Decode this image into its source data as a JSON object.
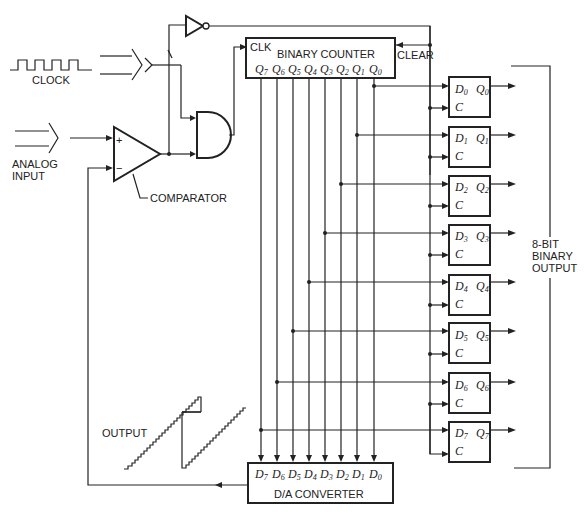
{
  "diagram": {
    "type": "ramp-type analog-to-digital converter block diagram",
    "labels": {
      "clock": "CLOCK",
      "analog_input_line1": "ANALOG",
      "analog_input_line2": "INPUT",
      "comparator": "COMPARATOR",
      "comparator_plus": "+",
      "comparator_minus": "−",
      "output_waveform": "OUTPUT",
      "binary_output_line1": "8-BIT",
      "binary_output_line2": "BINARY",
      "binary_output_line3": "OUTPUT",
      "clear": "CLEAR"
    },
    "binary_counter": {
      "title": "BINARY COUNTER",
      "clk_label": "CLK",
      "outputs": [
        {
          "letter": "Q",
          "sub": "7"
        },
        {
          "letter": "Q",
          "sub": "6"
        },
        {
          "letter": "Q",
          "sub": "5"
        },
        {
          "letter": "Q",
          "sub": "4"
        },
        {
          "letter": "Q",
          "sub": "3"
        },
        {
          "letter": "Q",
          "sub": "2"
        },
        {
          "letter": "Q",
          "sub": "1"
        },
        {
          "letter": "Q",
          "sub": "0"
        }
      ]
    },
    "da_converter": {
      "title": "D/A CONVERTER",
      "inputs": [
        {
          "letter": "D",
          "sub": "7"
        },
        {
          "letter": "D",
          "sub": "6"
        },
        {
          "letter": "D",
          "sub": "5"
        },
        {
          "letter": "D",
          "sub": "4"
        },
        {
          "letter": "D",
          "sub": "3"
        },
        {
          "letter": "D",
          "sub": "2"
        },
        {
          "letter": "D",
          "sub": "1"
        },
        {
          "letter": "D",
          "sub": "0"
        }
      ]
    },
    "latches": [
      {
        "d": "D",
        "d_sub": "0",
        "q": "Q",
        "q_sub": "0",
        "c": "C"
      },
      {
        "d": "D",
        "d_sub": "1",
        "q": "Q",
        "q_sub": "1",
        "c": "C"
      },
      {
        "d": "D",
        "d_sub": "2",
        "q": "Q",
        "q_sub": "2",
        "c": "C"
      },
      {
        "d": "D",
        "d_sub": "3",
        "q": "Q",
        "q_sub": "3",
        "c": "C"
      },
      {
        "d": "D",
        "d_sub": "4",
        "q": "Q",
        "q_sub": "4",
        "c": "C"
      },
      {
        "d": "D",
        "d_sub": "5",
        "q": "Q",
        "q_sub": "5",
        "c": "C"
      },
      {
        "d": "D",
        "d_sub": "6",
        "q": "Q",
        "q_sub": "6",
        "c": "C"
      },
      {
        "d": "D",
        "d_sub": "7",
        "q": "Q",
        "q_sub": "7",
        "c": "C"
      }
    ],
    "components": [
      "clock-source",
      "comparator",
      "and-gate",
      "inverter",
      "binary-counter",
      "d-latch-array",
      "da-converter"
    ]
  }
}
